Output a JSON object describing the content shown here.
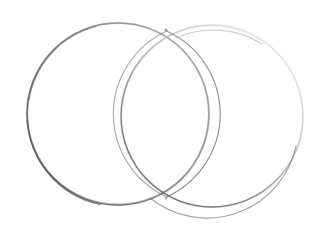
{
  "image": {
    "title": "Two overlapping circles (Venn diagram)",
    "kind": "hand-drawn-sketch",
    "medium": "pencil on white paper",
    "width": 323,
    "height": 230,
    "background_color": "#ffffff",
    "shape_count": "2",
    "caption": ""
  },
  "palette": {
    "background": "#ffffff",
    "stroke_dark": "#555555",
    "stroke_mid": "#8a8a8a",
    "stroke_light": "#bdbdbd",
    "stroke_faint": "#dedede",
    "paper_tint": "#fafaf9"
  },
  "figure": {
    "type": "venn-diagram",
    "regions": [
      {
        "id": "left-only",
        "label": ""
      },
      {
        "id": "intersection",
        "label": ""
      },
      {
        "id": "right-only",
        "label": ""
      }
    ],
    "shapes": [
      {
        "id": "circle-left",
        "name": "left-circle",
        "cx": 118,
        "cy": 114,
        "r": 91,
        "stroke": "#6f6f6f",
        "stroke_width": "1.4",
        "fill": "none",
        "bbox": {
          "x1": 27,
          "y1": 23,
          "x2": 209,
          "y2": 205
        }
      },
      {
        "id": "circle-right",
        "name": "right-circle",
        "cx": 212,
        "cy": 116,
        "r": 91,
        "stroke": "#9a9a9a",
        "stroke_width": "1.3",
        "fill": "none",
        "bbox": {
          "x1": 121,
          "y1": 25,
          "x2": 303,
          "y2": 207
        }
      }
    ],
    "intersection_points": [
      {
        "id": "top-crossing",
        "x": 166,
        "y": 30
      },
      {
        "id": "bottom-crossing",
        "x": 166,
        "y": 198
      }
    ],
    "overlap_extent": {
      "x1": 128,
      "y1": 30,
      "x2": 212,
      "y2": 198
    }
  },
  "annotations": {
    "labels": [],
    "legend": [],
    "notes": ""
  }
}
